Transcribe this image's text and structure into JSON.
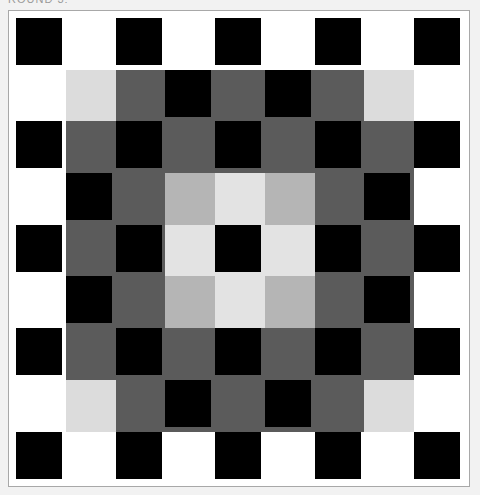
{
  "header": {
    "title": "ROUND 3:"
  },
  "colors": {
    "black": "#000000",
    "white": "#ffffff",
    "dark_gray": "#5b5b5b",
    "light_gray_corner": "#dcdcdc",
    "mid_gray": "#b5b5b5",
    "light": "#e3e3e3",
    "frame_border": "#a8a8a8",
    "page_background": "#f2f2f2"
  },
  "board": {
    "rows": 9,
    "cols": 9,
    "legend": {
      "B": "black",
      "W": "white",
      "DG": "dark gray",
      "LG": "light gray",
      "MG": "mid gray",
      "L": "light"
    },
    "grid": [
      [
        "B",
        "W",
        "B",
        "W",
        "B",
        "W",
        "B",
        "W",
        "B"
      ],
      [
        "W",
        "LG",
        "DG",
        "B",
        "DG",
        "B",
        "DG",
        "LG",
        "W"
      ],
      [
        "B",
        "DG",
        "B",
        "DG",
        "B",
        "DG",
        "B",
        "DG",
        "B"
      ],
      [
        "W",
        "B",
        "DG",
        "MG",
        "L",
        "MG",
        "DG",
        "B",
        "W"
      ],
      [
        "B",
        "DG",
        "B",
        "L",
        "B",
        "L",
        "B",
        "DG",
        "B"
      ],
      [
        "W",
        "B",
        "DG",
        "MG",
        "L",
        "MG",
        "DG",
        "B",
        "W"
      ],
      [
        "B",
        "DG",
        "B",
        "DG",
        "B",
        "DG",
        "B",
        "DG",
        "B"
      ],
      [
        "W",
        "LG",
        "DG",
        "B",
        "DG",
        "B",
        "DG",
        "LG",
        "W"
      ],
      [
        "B",
        "W",
        "B",
        "W",
        "B",
        "W",
        "B",
        "W",
        "B"
      ]
    ]
  }
}
